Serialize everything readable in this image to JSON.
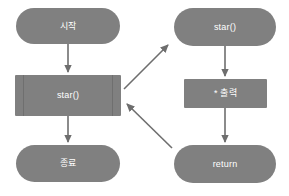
{
  "diagram": {
    "background_color": "#ffffff",
    "node_fill_color": "#808080",
    "node_text_color": "#ffffff",
    "edge_color": "#6e6e6e",
    "nodes": [
      {
        "id": "start",
        "label": "시작",
        "shape": "pill",
        "column": "left"
      },
      {
        "id": "call",
        "label": "star()",
        "shape": "subroutine",
        "column": "left"
      },
      {
        "id": "end",
        "label": "종료",
        "shape": "pill",
        "column": "left"
      },
      {
        "id": "func",
        "label": "star()",
        "shape": "pill",
        "column": "right"
      },
      {
        "id": "print",
        "label": "* 출력",
        "shape": "rect",
        "column": "right"
      },
      {
        "id": "return",
        "label": "return",
        "shape": "pill",
        "column": "right"
      }
    ],
    "edges": [
      {
        "from": "start",
        "to": "call",
        "kind": "vertical"
      },
      {
        "from": "call",
        "to": "end",
        "kind": "vertical"
      },
      {
        "from": "func",
        "to": "print",
        "kind": "vertical"
      },
      {
        "from": "print",
        "to": "return",
        "kind": "vertical"
      },
      {
        "from": "call",
        "to": "func",
        "kind": "diagonal"
      },
      {
        "from": "return",
        "to": "call",
        "kind": "diagonal"
      }
    ]
  }
}
